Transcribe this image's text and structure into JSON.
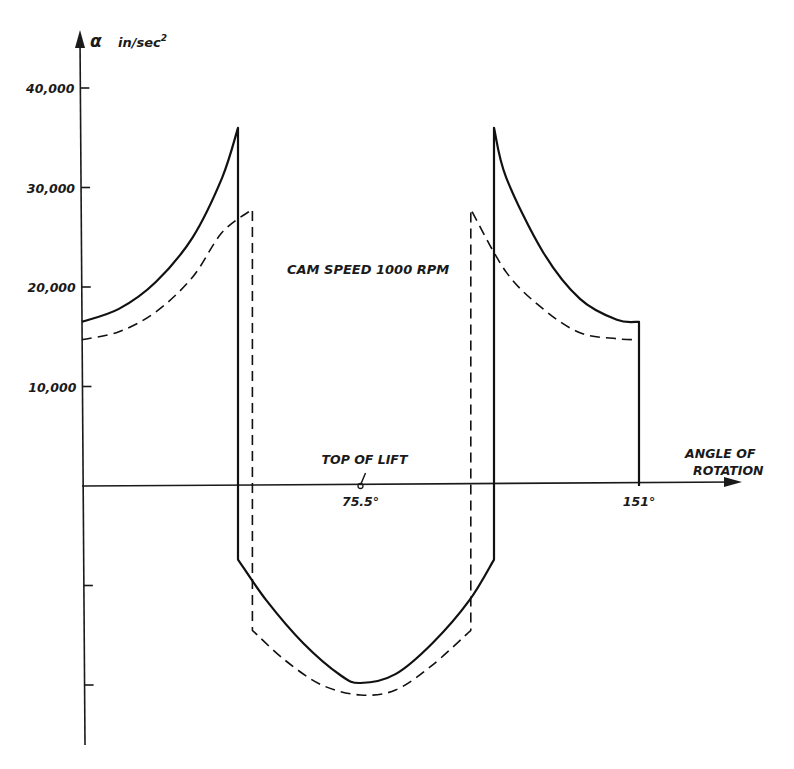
{
  "chart_data": {
    "type": "line",
    "title": "CAM SPEED 1000 RPM",
    "ylabel": "α in/sec²",
    "ylabel_symbol": "α",
    "ylabel_unit": "in/sec",
    "ylabel_unit_sup": "2",
    "xlabel_line1": "ANGLE OF",
    "xlabel_line2": "ROTATION",
    "y_ticks": [
      {
        "value": 40000,
        "label": "40,000"
      },
      {
        "value": 30000,
        "label": "30,000"
      },
      {
        "value": 20000,
        "label": "20,000"
      },
      {
        "value": 10000,
        "label": "10,000"
      },
      {
        "value": -10000,
        "label": ""
      },
      {
        "value": -20000,
        "label": ""
      }
    ],
    "x_annotations": [
      {
        "value": 75.5,
        "label": "75.5°",
        "note": "TOP OF LIFT"
      },
      {
        "value": 151,
        "label": "151°"
      }
    ],
    "xlim": [
      0,
      151
    ],
    "ylim": [
      -26000,
      46000
    ],
    "grid": false,
    "legend": "none",
    "series": [
      {
        "name": "solid",
        "style": "solid",
        "points": [
          [
            0,
            16500
          ],
          [
            10,
            17800
          ],
          [
            20,
            20500
          ],
          [
            30,
            25000
          ],
          [
            38,
            31000
          ],
          [
            42.3,
            36000
          ],
          [
            42.3,
            -7400
          ],
          [
            50,
            -11500
          ],
          [
            60,
            -15800
          ],
          [
            70,
            -19000
          ],
          [
            75.5,
            -19800
          ],
          [
            85,
            -18900
          ],
          [
            95,
            -15800
          ],
          [
            105,
            -11500
          ],
          [
            111.7,
            -7400
          ],
          [
            111.7,
            36000
          ],
          [
            115,
            31000
          ],
          [
            125,
            23500
          ],
          [
            135,
            18800
          ],
          [
            145,
            16700
          ],
          [
            151,
            16500
          ],
          [
            151,
            0
          ]
        ]
      },
      {
        "name": "dashed",
        "style": "dashed",
        "points": [
          [
            0,
            14700
          ],
          [
            10,
            15500
          ],
          [
            20,
            17500
          ],
          [
            30,
            21000
          ],
          [
            38,
            25500
          ],
          [
            46.2,
            27800
          ],
          [
            46.2,
            -14500
          ],
          [
            55,
            -17500
          ],
          [
            65,
            -20000
          ],
          [
            75.5,
            -21000
          ],
          [
            85,
            -20500
          ],
          [
            95,
            -18000
          ],
          [
            105.4,
            -14500
          ],
          [
            105.4,
            27800
          ],
          [
            115,
            21500
          ],
          [
            125,
            17800
          ],
          [
            135,
            15400
          ],
          [
            145,
            14800
          ],
          [
            151,
            14700
          ]
        ]
      }
    ],
    "caption_partial": "Fig. 7.8 and 7.9"
  }
}
